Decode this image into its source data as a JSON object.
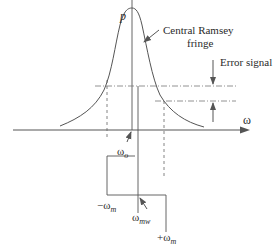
{
  "diagram": {
    "axis_labels": {
      "y": "p",
      "x": "ω"
    },
    "annotations": {
      "fringe_line1": "Central Ramsey",
      "fringe_line2": "fringe",
      "error_signal": "Error signal"
    },
    "frequency_labels": {
      "omega_o_base": "ω",
      "omega_o_sub": "o",
      "minus_omega_m_base": "−ω",
      "minus_omega_m_sub": "m",
      "omega_mw_base": "ω",
      "omega_mw_sub": "mw",
      "plus_omega_m_base": "+ω",
      "plus_omega_m_sub": "m"
    },
    "colors": {
      "line": "#555555",
      "text": "#2a2a2a",
      "background": "#ffffff"
    }
  }
}
